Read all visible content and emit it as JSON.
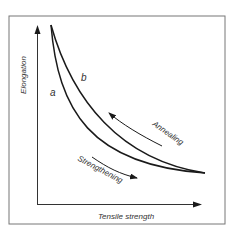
{
  "diagram": {
    "xlabel": "Tensile strength",
    "ylabel": "Elongation",
    "curves": [
      {
        "id": "a",
        "label": "a"
      },
      {
        "id": "b",
        "label": "b"
      }
    ],
    "annotations": {
      "annealing": "Annealing",
      "strengthening": "Strengthening"
    },
    "colors": {
      "line": "#1a1a1a",
      "frame": "#666666",
      "text": "#333333"
    }
  }
}
